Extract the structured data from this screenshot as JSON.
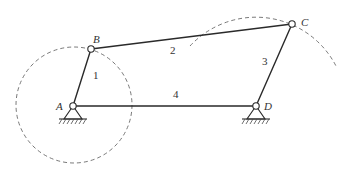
{
  "diagram": {
    "type": "four-bar-linkage",
    "joints": [
      {
        "id": "A",
        "label": "A",
        "x": 73,
        "y": 106,
        "fixed": true
      },
      {
        "id": "B",
        "label": "B",
        "x": 91,
        "y": 49,
        "fixed": false
      },
      {
        "id": "C",
        "label": "C",
        "x": 292,
        "y": 24,
        "fixed": false
      },
      {
        "id": "D",
        "label": "D",
        "x": 256,
        "y": 106,
        "fixed": true
      }
    ],
    "links": [
      {
        "id": "1",
        "label": "1",
        "from": "A",
        "to": "B"
      },
      {
        "id": "2",
        "label": "2",
        "from": "B",
        "to": "C"
      },
      {
        "id": "3",
        "label": "3",
        "from": "C",
        "to": "D"
      },
      {
        "id": "4",
        "label": "4",
        "from": "A",
        "to": "D"
      }
    ],
    "paths": [
      {
        "name": "crank-circle",
        "center": "A",
        "radius": 58,
        "style": "dashed"
      },
      {
        "name": "rocker-arc",
        "center": "D",
        "radius": 90,
        "style": "dashed"
      }
    ],
    "colors": {
      "line": "#2a2a2a",
      "dashed": "#6a6a6a",
      "text": "#333333",
      "background": "#ffffff"
    }
  }
}
